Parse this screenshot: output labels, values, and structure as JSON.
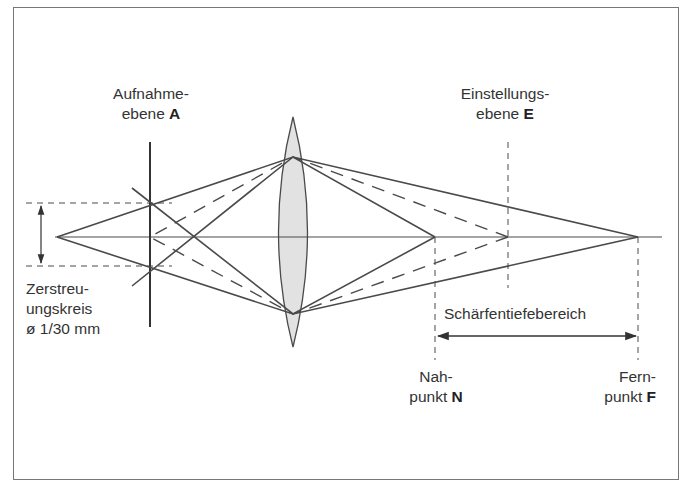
{
  "diagram": {
    "type": "optics-depth-of-field",
    "labels": {
      "aufnahme_line1": "Aufnahme-",
      "aufnahme_line2_text": "ebene ",
      "aufnahme_letter": "A",
      "einstellung_line1": "Einstellungs-",
      "einstellung_line2_text": "ebene ",
      "einstellung_letter": "E",
      "zerstreu_line1": "Zerstreu-",
      "zerstreu_line2": "ungskreis",
      "zerstreu_line3": "ø 1/30 mm",
      "range": "Schärfentiefebereich",
      "nah_line1": "Nah-",
      "nah_line2_text": "punkt ",
      "nah_letter": "N",
      "fern_line1": "Fern-",
      "fern_line2_text": "punkt ",
      "fern_letter": "F"
    },
    "colors": {
      "line": "#4a4a4a",
      "lens_fill": "#e2e2e2",
      "frame": "#777777",
      "text": "#333333"
    },
    "elements": {
      "optical_axis": {
        "x1": 55,
        "x2": 662,
        "y": 237
      },
      "object_point": {
        "x": 57,
        "y": 237
      },
      "recording_plane_A": {
        "x": 150,
        "y1": 142,
        "y2": 327
      },
      "circle_of_confusion": {
        "y_top": 203,
        "y_bottom": 266
      },
      "lens": {
        "cx": 293,
        "top": 117,
        "bottom": 347,
        "half_width": 29
      },
      "lens_ray_points": {
        "top": [
          293,
          157
        ],
        "bottom": [
          293,
          314
        ]
      },
      "near_point_N": {
        "x": 435,
        "y": 237
      },
      "focus_plane_E": {
        "x": 508,
        "y": 237
      },
      "far_point_F": {
        "x": 638,
        "y": 237
      },
      "depth_range_arrow": {
        "x1": 437,
        "x2": 637,
        "y": 336
      }
    }
  }
}
